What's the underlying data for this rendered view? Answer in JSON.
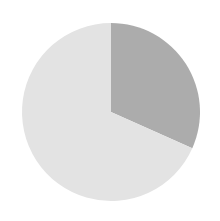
{
  "chart_data": {
    "type": "pie",
    "title": "",
    "xlabel": "",
    "ylabel": "",
    "grid": false,
    "legend": "none",
    "labels_visible": false,
    "start_angle_deg": 0,
    "direction": "clockwise",
    "center": {
      "x": 111,
      "y": 112
    },
    "radius": 89,
    "categories": [
      "Slice 1",
      "Slice 2"
    ],
    "values": [
      31.6,
      68.4
    ],
    "angles_deg": [
      114,
      246
    ],
    "colors": [
      "#acacac",
      "#e3e3e3"
    ],
    "slices": [
      {
        "label": "Slice 1",
        "value": 31.6,
        "angle_deg": 114,
        "color": "#acacac",
        "start_deg": 0,
        "end_deg": 114
      },
      {
        "label": "Slice 2",
        "value": 68.4,
        "angle_deg": 246,
        "color": "#e3e3e3",
        "start_deg": 114,
        "end_deg": 360
      }
    ]
  },
  "figure": {
    "background_color": "#ffffff",
    "width": 220,
    "height": 221
  }
}
